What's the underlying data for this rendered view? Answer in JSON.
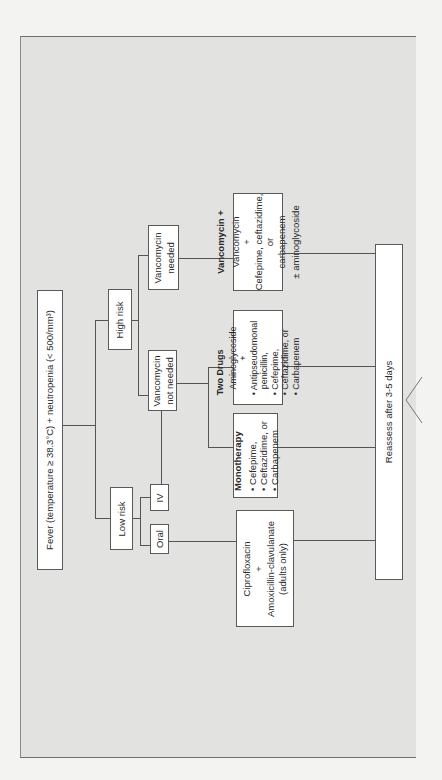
{
  "diagram": {
    "start": {
      "text": "Fever (temperature ≥ 38.3°C) + neutropenia (< 500/mm³)"
    },
    "risk": {
      "low": "Low risk",
      "high": "High risk"
    },
    "route": {
      "oral": "Oral",
      "iv": "IV"
    },
    "vancomycin": {
      "needed_line1": "Vancomycin",
      "needed_line2": "needed",
      "not_needed_line1": "Vancomycin",
      "not_needed_line2": "not needed"
    },
    "treatments": {
      "vanco_plus": {
        "title": "Vancomycin +",
        "lines": [
          "Vancomycin",
          "+",
          "Cefepime, ceftazidime,",
          "or",
          "carbapenem",
          "",
          "± aminoglycoside"
        ]
      },
      "two_drugs": {
        "title": "Two Drugs",
        "lines": [
          "Aminoglycoside",
          "+",
          "• Antipseudomonal",
          "  penicillin,",
          "• Cefepime,",
          "• Ceftazidime, or",
          "• Carbapenem"
        ]
      },
      "monotherapy": {
        "title": "Monotherapy",
        "lines": [
          "• Cefepime,",
          "• Ceftazidime, or",
          "• Carbapenem"
        ]
      },
      "oral_regimen": {
        "lines": [
          "Ciprofloxacin",
          "+",
          "Amoxicillin-clavulanate",
          "(adults only)"
        ]
      }
    },
    "end": {
      "text": "Reassess after 3-5 days"
    }
  }
}
